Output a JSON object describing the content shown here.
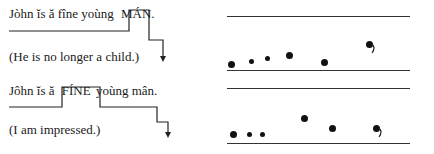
{
  "examples": [
    {
      "sentence_parts": [
        "Jòhn ĭs ă fîne yoùng",
        "MÁN",
        "."
      ],
      "gloss": "(He is no longer a child.)",
      "pitch_dots": [
        {
          "x": 231,
          "y": 64,
          "size": 7
        },
        {
          "x": 251,
          "y": 61,
          "size": 5
        },
        {
          "x": 267,
          "y": 58,
          "size": 5
        },
        {
          "x": 289,
          "y": 55,
          "size": 7
        },
        {
          "x": 324,
          "y": 62,
          "size": 7
        },
        {
          "x": 369,
          "y": 44,
          "size": 7,
          "tail": true
        }
      ]
    },
    {
      "sentence_parts": [
        "Jôhn ĭs ă",
        "FÍNE",
        "yoùng mân."
      ],
      "gloss": "(I am impressed.)",
      "pitch_dots": [
        {
          "x": 233,
          "y": 134,
          "size": 7
        },
        {
          "x": 249,
          "y": 134,
          "size": 5
        },
        {
          "x": 262,
          "y": 134,
          "size": 5
        },
        {
          "x": 304,
          "y": 118,
          "size": 7
        },
        {
          "x": 332,
          "y": 128,
          "size": 7
        },
        {
          "x": 376,
          "y": 128,
          "size": 7,
          "tail": true
        }
      ]
    }
  ],
  "colors": {
    "ink": "#1a1a1a",
    "line": "#333333"
  }
}
